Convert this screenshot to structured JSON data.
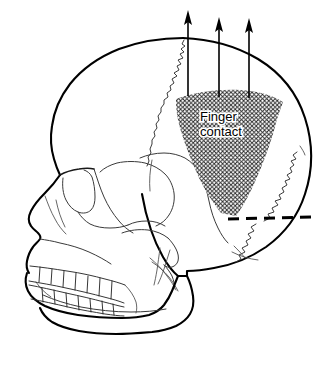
{
  "figure": {
    "background_color": "#ffffff",
    "line_color": "#000000",
    "width": 336,
    "height": 381
  },
  "annotations": {
    "contact_label_line1": "Finger",
    "contact_label_line2": "contact",
    "hatched_region_name": "finger-contact-zone",
    "hatch_angle_degrees": 45,
    "hatch_spacing_px": 4
  },
  "force_arrows": {
    "count": 3,
    "direction": "up",
    "color": "#000000",
    "arrows": [
      {
        "x": 188,
        "y_tip": 11,
        "y_tail": 96
      },
      {
        "x": 219,
        "y_tip": 18,
        "y_tail": 97
      },
      {
        "x": 249,
        "y_tip": 19,
        "y_tail": 98
      }
    ]
  },
  "dashed_marker": {
    "name": "section-dashed-line",
    "x_start": 228,
    "x_end": 312,
    "y": 219,
    "color": "#000000",
    "dash_pattern": "11 7"
  },
  "anatomy": {
    "regions": [
      "frontal-bone",
      "parietal-bone",
      "occipital-bone",
      "temporal-bone",
      "sphenoid-bone",
      "zygomatic-arch",
      "maxilla",
      "mandible",
      "nasal-aperture",
      "orbit",
      "upper-teeth",
      "lower-teeth",
      "mastoid-process",
      "styloid-process"
    ],
    "sutures": [
      "coronal-suture",
      "squamous-suture",
      "lambdoid-suture"
    ]
  }
}
